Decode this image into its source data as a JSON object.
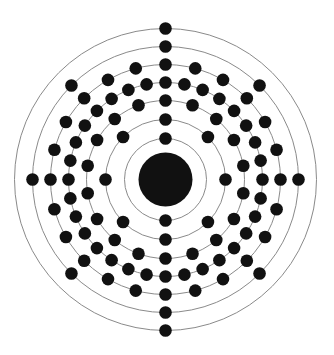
{
  "diagram": {
    "type": "bohr-model",
    "element": "Plutonium",
    "atomic_number": 94,
    "electron_configuration": [
      2,
      8,
      18,
      32,
      24,
      8,
      2
    ],
    "center": {
      "x": 165.5,
      "y": 179.5
    },
    "nucleus": {
      "radius": 27,
      "color": "#111111"
    },
    "electron": {
      "radius": 6.3,
      "color": "#111111"
    },
    "orbit_line_color": "#8a8a8a",
    "shells": [
      {
        "n": 1,
        "radius": 41,
        "electrons": 2,
        "start_angle_deg": 0
      },
      {
        "n": 2,
        "radius": 60,
        "electrons": 8,
        "start_angle_deg": 0
      },
      {
        "n": 3,
        "radius": 79,
        "electrons": 18,
        "start_angle_deg": 0
      },
      {
        "n": 4,
        "radius": 97,
        "electrons": 32,
        "start_angle_deg": 0
      },
      {
        "n": 5,
        "radius": 115,
        "electrons": 24,
        "start_angle_deg": 0
      },
      {
        "n": 6,
        "radius": 133,
        "electrons": 8,
        "start_angle_deg": 0
      },
      {
        "n": 7,
        "radius": 151,
        "electrons": 2,
        "start_angle_deg": 0
      }
    ]
  }
}
